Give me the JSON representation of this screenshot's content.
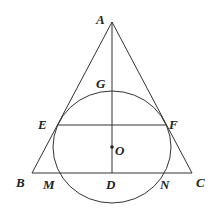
{
  "figure": {
    "type": "geometry",
    "colors": {
      "stroke": "#333333",
      "text": "#222222",
      "background": "#ffffff"
    }
  },
  "points": {
    "A": {
      "label": "A"
    },
    "B": {
      "label": "B"
    },
    "C": {
      "label": "C"
    },
    "D": {
      "label": "D"
    },
    "E": {
      "label": "E"
    },
    "F": {
      "label": "F"
    },
    "G": {
      "label": "G"
    },
    "M": {
      "label": "M"
    },
    "N": {
      "label": "N"
    },
    "O": {
      "label": "O"
    }
  },
  "segments": [
    "AB",
    "AC",
    "BC",
    "AD",
    "EF"
  ],
  "circles": [
    {
      "center": "O",
      "through": [
        "E",
        "F",
        "G",
        "M",
        "N"
      ]
    }
  ]
}
